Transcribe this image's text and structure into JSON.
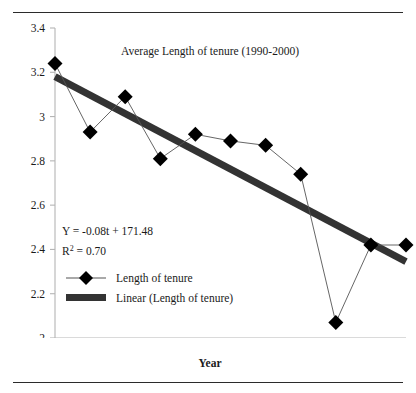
{
  "figure": {
    "top_rule": "horizontal-rule",
    "bottom_rule": "horizontal-rule"
  },
  "chart_data": {
    "type": "line",
    "title": "Average Length of tenure (1990-2000)",
    "xlabel": "Year",
    "ylabel": "",
    "xlim": [
      1990,
      2000
    ],
    "ylim": [
      2,
      3.4
    ],
    "xticks": [
      "1990",
      "1992",
      "1994",
      "1996",
      "1998",
      "20"
    ],
    "xtick_values": [
      1990,
      1992,
      1994,
      1996,
      1998,
      2000
    ],
    "yticks": [
      "2",
      "2.2",
      "2.4",
      "2.6",
      "2.8",
      "3",
      "3.2",
      "3.4"
    ],
    "ytick_values": [
      2,
      2.2,
      2.4,
      2.6,
      2.8,
      3,
      3.2,
      3.4
    ],
    "grid": false,
    "legend_position": "inside-lower-left",
    "x": [
      1990,
      1991,
      1992,
      1993,
      1994,
      1995,
      1996,
      1997,
      1998,
      1999,
      2000
    ],
    "series": [
      {
        "name": "Length of tenure",
        "type": "line-marker",
        "marker": "diamond",
        "color": "#000000",
        "values": [
          3.24,
          2.93,
          3.09,
          2.81,
          2.92,
          2.89,
          2.87,
          2.74,
          2.07,
          2.42,
          2.42
        ]
      },
      {
        "name": "Linear (Length of tenure)",
        "type": "trendline",
        "color": "#333333",
        "endpoints": [
          [
            1990,
            3.18
          ],
          [
            2000,
            2.345
          ]
        ]
      }
    ],
    "annotations": [
      {
        "id": "equation",
        "text": "Y = -0.08t + 171.48"
      },
      {
        "id": "r-squared",
        "text_prefix": "R",
        "text_sup": "2",
        "text_suffix": " = 0.70"
      }
    ],
    "legend_entries": [
      {
        "label": "Length of tenure",
        "glyph": "line-with-diamond"
      },
      {
        "label": "Linear (Length of tenure)",
        "glyph": "thick-bar"
      }
    ],
    "colors": {
      "marker": "#000000",
      "series_line": "#555555",
      "trendline": "#333333",
      "axis": "#b5b5b5",
      "text": "#1a1a1a",
      "rule": "#2b2b2b"
    }
  }
}
